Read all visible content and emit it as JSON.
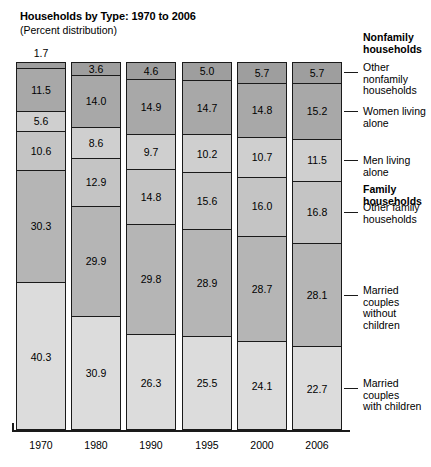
{
  "title": "Households by Type: 1970 to 2006",
  "subtitle": "(Percent distribution)",
  "colors": {
    "other_nonfamily": "#9e9e9e",
    "women_alone": "#a8a8a8",
    "men_alone": "#cfcfcf",
    "other_family": "#c4c4c4",
    "married_without_children": "#b5b5b5",
    "married_with_children": "#dcdcdc",
    "outline": "#1a1a1a",
    "background": "#ffffff"
  },
  "legend": {
    "nonfamily_header": "Nonfamily\nhouseholds",
    "family_header": "Family households",
    "items": [
      {
        "key": "other_nonfamily",
        "label": "Other nonfamily\nhouseholds"
      },
      {
        "key": "women_alone",
        "label": "Women living alone"
      },
      {
        "key": "men_alone",
        "label": "Men living alone"
      },
      {
        "key": "other_family",
        "label": "Other family\nhouseholds"
      },
      {
        "key": "married_without_children",
        "label": "Married couples\nwithout children"
      },
      {
        "key": "married_with_children",
        "label": "Married couples\nwith children"
      }
    ]
  },
  "chart_data": {
    "type": "bar",
    "title": "Households by Type: 1970 to 2006",
    "subtitle": "(Percent distribution)",
    "xlabel": "",
    "ylabel": "Percent distribution",
    "ylim": [
      0,
      100
    ],
    "stacked": true,
    "grid": false,
    "legend_position": "right",
    "categories": [
      "1970",
      "1980",
      "1990",
      "1995",
      "2000",
      "2006"
    ],
    "series": [
      {
        "name": "Other nonfamily households",
        "values": [
          1.7,
          3.6,
          4.6,
          5.0,
          5.7,
          5.7
        ]
      },
      {
        "name": "Women living alone",
        "values": [
          11.5,
          14.0,
          14.9,
          14.7,
          14.8,
          15.2
        ]
      },
      {
        "name": "Men living alone",
        "values": [
          5.6,
          8.6,
          9.7,
          10.2,
          10.7,
          11.5
        ]
      },
      {
        "name": "Other family households",
        "values": [
          10.6,
          12.9,
          14.8,
          15.6,
          16.0,
          16.8
        ]
      },
      {
        "name": "Married couples without children",
        "values": [
          30.3,
          29.9,
          29.8,
          28.9,
          28.7,
          28.1
        ]
      },
      {
        "name": "Married couples with children",
        "values": [
          40.3,
          30.9,
          26.3,
          25.5,
          24.1,
          22.7
        ]
      }
    ]
  },
  "bars": [
    {
      "year": "1970",
      "top_label_outside": "1.7",
      "segments": [
        {
          "key": "other_nonfamily",
          "value": "1.7",
          "pct": 1.7,
          "thin": true
        },
        {
          "key": "women_alone",
          "value": "11.5",
          "pct": 11.5,
          "thin": false
        },
        {
          "key": "men_alone",
          "value": "5.6",
          "pct": 5.6,
          "thin": false
        },
        {
          "key": "other_family",
          "value": "10.6",
          "pct": 10.6,
          "thin": false
        },
        {
          "key": "married_without_children",
          "value": "30.3",
          "pct": 30.3,
          "thin": false
        },
        {
          "key": "married_with_children",
          "value": "40.3",
          "pct": 40.3,
          "thin": false
        }
      ]
    },
    {
      "year": "1980",
      "top_label_outside": null,
      "segments": [
        {
          "key": "other_nonfamily",
          "value": "3.6",
          "pct": 3.6,
          "thin": false
        },
        {
          "key": "women_alone",
          "value": "14.0",
          "pct": 14.0,
          "thin": false
        },
        {
          "key": "men_alone",
          "value": "8.6",
          "pct": 8.6,
          "thin": false
        },
        {
          "key": "other_family",
          "value": "12.9",
          "pct": 12.9,
          "thin": false
        },
        {
          "key": "married_without_children",
          "value": "29.9",
          "pct": 29.9,
          "thin": false
        },
        {
          "key": "married_with_children",
          "value": "30.9",
          "pct": 30.9,
          "thin": false
        }
      ]
    },
    {
      "year": "1990",
      "top_label_outside": null,
      "segments": [
        {
          "key": "other_nonfamily",
          "value": "4.6",
          "pct": 4.6,
          "thin": false
        },
        {
          "key": "women_alone",
          "value": "14.9",
          "pct": 14.9,
          "thin": false
        },
        {
          "key": "men_alone",
          "value": "9.7",
          "pct": 9.7,
          "thin": false
        },
        {
          "key": "other_family",
          "value": "14.8",
          "pct": 14.8,
          "thin": false
        },
        {
          "key": "married_without_children",
          "value": "29.8",
          "pct": 29.8,
          "thin": false
        },
        {
          "key": "married_with_children",
          "value": "26.3",
          "pct": 26.3,
          "thin": false
        }
      ]
    },
    {
      "year": "1995",
      "top_label_outside": null,
      "segments": [
        {
          "key": "other_nonfamily",
          "value": "5.0",
          "pct": 5.0,
          "thin": false
        },
        {
          "key": "women_alone",
          "value": "14.7",
          "pct": 14.7,
          "thin": false
        },
        {
          "key": "men_alone",
          "value": "10.2",
          "pct": 10.2,
          "thin": false
        },
        {
          "key": "other_family",
          "value": "15.6",
          "pct": 15.6,
          "thin": false
        },
        {
          "key": "married_without_children",
          "value": "28.9",
          "pct": 28.9,
          "thin": false
        },
        {
          "key": "married_with_children",
          "value": "25.5",
          "pct": 25.5,
          "thin": false
        }
      ]
    },
    {
      "year": "2000",
      "top_label_outside": null,
      "segments": [
        {
          "key": "other_nonfamily",
          "value": "5.7",
          "pct": 5.7,
          "thin": false
        },
        {
          "key": "women_alone",
          "value": "14.8",
          "pct": 14.8,
          "thin": false
        },
        {
          "key": "men_alone",
          "value": "10.7",
          "pct": 10.7,
          "thin": false
        },
        {
          "key": "other_family",
          "value": "16.0",
          "pct": 16.0,
          "thin": false
        },
        {
          "key": "married_without_children",
          "value": "28.7",
          "pct": 28.7,
          "thin": false
        },
        {
          "key": "married_with_children",
          "value": "24.1",
          "pct": 24.1,
          "thin": false
        }
      ]
    },
    {
      "year": "2006",
      "top_label_outside": null,
      "segments": [
        {
          "key": "other_nonfamily",
          "value": "5.7",
          "pct": 5.7,
          "thin": false
        },
        {
          "key": "women_alone",
          "value": "15.2",
          "pct": 15.2,
          "thin": false
        },
        {
          "key": "men_alone",
          "value": "11.5",
          "pct": 11.5,
          "thin": false
        },
        {
          "key": "other_family",
          "value": "16.8",
          "pct": 16.8,
          "thin": false
        },
        {
          "key": "married_without_children",
          "value": "28.1",
          "pct": 28.1,
          "thin": false
        },
        {
          "key": "married_with_children",
          "value": "22.7",
          "pct": 22.7,
          "thin": false
        }
      ]
    }
  ]
}
